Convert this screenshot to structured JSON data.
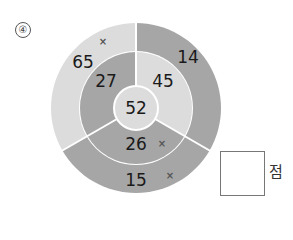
{
  "question": {
    "number": "④"
  },
  "colors": {
    "light": "#dcdcdc",
    "dark": "#a6a6a6",
    "divider": "#ffffff",
    "text": "#1a1a1a",
    "mark": "#555555"
  },
  "diagram": {
    "center": {
      "value": "52"
    },
    "segments": [
      {
        "position": "top-left",
        "outer": {
          "value": "65",
          "mark": "×",
          "shade": "light"
        },
        "inner": {
          "value": "27",
          "shade": "dark"
        }
      },
      {
        "position": "top-right",
        "outer": {
          "value": "14",
          "shade": "dark"
        },
        "inner": {
          "value": "45",
          "shade": "light"
        }
      },
      {
        "position": "bottom",
        "outer": {
          "value": "15",
          "mark": "×",
          "shade": "dark"
        },
        "inner": {
          "value": "26",
          "mark": "×",
          "shade": "dark"
        }
      }
    ]
  },
  "answer": {
    "unit": "점",
    "value": ""
  }
}
